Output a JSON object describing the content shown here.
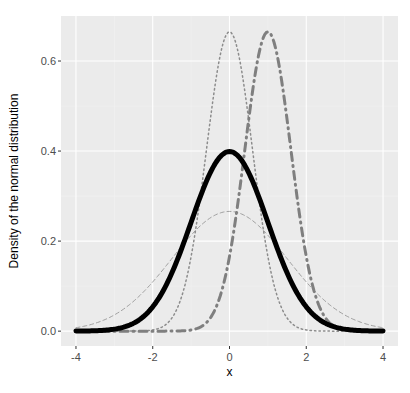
{
  "chart_data": {
    "type": "line",
    "title": "",
    "xlabel": "x",
    "ylabel": "Density of the normal distribution",
    "xlim": [
      -4.39,
      4.39
    ],
    "ylim": [
      -0.033,
      0.7
    ],
    "x_ticks": [
      -4,
      -2,
      0,
      2,
      4
    ],
    "x_tick_labels": [
      "-4",
      "-2",
      "0",
      "2",
      "4"
    ],
    "y_ticks": [
      0.0,
      0.2,
      0.4,
      0.6
    ],
    "y_tick_labels": [
      "0.0",
      "0.2",
      "0.4",
      "0.6"
    ],
    "grid": true,
    "legend": "none",
    "x_range": [
      -4,
      4
    ],
    "series": [
      {
        "name": "N(0,1)",
        "mean": 0,
        "sd": 1,
        "peak": 0.399,
        "linetype": "solid",
        "color": "#000000",
        "width": 5
      },
      {
        "name": "N(0,0.6)",
        "mean": 0,
        "sd": 0.6,
        "peak": 0.665,
        "linetype": "dotted",
        "color": "#8c8c8c",
        "width": 1.5
      },
      {
        "name": "N(0,1.5)",
        "mean": 0,
        "sd": 1.5,
        "peak": 0.266,
        "linetype": "dashed",
        "color": "#a0a0a0",
        "width": 1
      },
      {
        "name": "N(1,0.6)",
        "mean": 1,
        "sd": 0.6,
        "peak": 0.665,
        "linetype": "dotdash",
        "color": "#7f7f7f",
        "width": 3
      }
    ]
  },
  "colors": {
    "panel_bg": "#ebebeb",
    "grid_major": "#ffffff",
    "grid_minor": "#f4f4f4"
  }
}
